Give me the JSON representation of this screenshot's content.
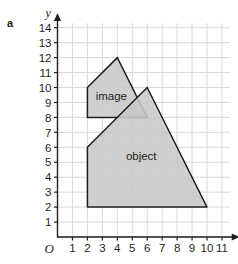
{
  "part_label": "a",
  "axes": {
    "x_name": "x",
    "y_name": "y",
    "origin_label": "O",
    "x_ticks": [
      "1",
      "2",
      "3",
      "4",
      "5",
      "6",
      "7",
      "8",
      "9",
      "10",
      "11"
    ],
    "y_ticks": [
      "1",
      "2",
      "3",
      "4",
      "5",
      "6",
      "7",
      "8",
      "9",
      "10",
      "11",
      "12",
      "13",
      "14"
    ]
  },
  "shapes": {
    "image_label": "image",
    "object_label": "object"
  },
  "colors": {
    "fill": "#c8c8c8",
    "outline": "#231f20",
    "grid": "#d8d8dc",
    "axis": "#231f20",
    "text": "#231f20",
    "background": "#ffffff"
  },
  "chart_data": {
    "type": "scatter",
    "title": "",
    "xlabel": "x",
    "ylabel": "y",
    "xlim": [
      0,
      11
    ],
    "ylim": [
      0,
      14
    ],
    "grid": true,
    "legend": "none",
    "series": [
      {
        "name": "image",
        "kind": "polygon",
        "label": "image",
        "label_at": [
          3.6,
          9.4
        ],
        "vertices": [
          [
            2,
            8
          ],
          [
            2,
            10
          ],
          [
            4,
            12
          ],
          [
            6,
            8
          ]
        ],
        "fill": "#c8c8c8",
        "outline": "#231f20"
      },
      {
        "name": "object",
        "kind": "polygon",
        "label": "object",
        "label_at": [
          5.6,
          5.4
        ],
        "vertices": [
          [
            2,
            2
          ],
          [
            2,
            6
          ],
          [
            6,
            10
          ],
          [
            10,
            2
          ]
        ],
        "fill": "#c8c8c8",
        "outline": "#231f20"
      }
    ]
  }
}
